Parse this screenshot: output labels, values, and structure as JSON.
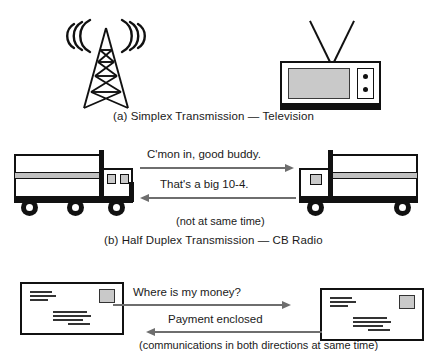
{
  "sections": {
    "simplex": {
      "caption": "(a)  Simplex Transmission  —  Television",
      "source_icon": "broadcast-tower-icon",
      "target_icon": "television-icon",
      "wave_arcs": 3
    },
    "half_duplex": {
      "caption": "(b) Half Duplex Transmission — CB Radio",
      "note": "(not at same time)",
      "message_outbound": "C'mon in, good buddy.",
      "message_inbound": "That's a big 10-4.",
      "left_icon": "truck-icon",
      "right_icon": "truck-icon"
    },
    "full_duplex": {
      "note": "(communications in both directions at same time)",
      "message_outbound": "Where is my money?",
      "message_inbound": "Payment enclosed",
      "left_icon": "envelope-icon",
      "right_icon": "envelope-icon"
    }
  },
  "colors": {
    "ink": "#111111",
    "arrow": "#6e6e6e",
    "screen_gray": "#c9c9c9",
    "stripe_gray": "#c0c0c0",
    "page": "#ffffff"
  }
}
